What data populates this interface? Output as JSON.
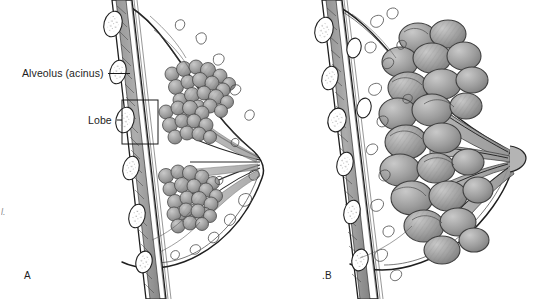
{
  "figure": {
    "type": "anatomical-illustration",
    "style": "grayscale pen-and-ink medical line drawing",
    "background_color": "#ffffff",
    "ink_color": "#1a1a1a",
    "tissue_fill_color": "#9a9a9a",
    "tissue_shadow_color": "#6e6e6e",
    "tissue_light_color": "#c8c8c8"
  },
  "labels": {
    "alveolus": "Alveolus (acinus)",
    "lobe": "Lobe"
  },
  "panels": [
    {
      "id": "A",
      "letter": "A",
      "caption": "A",
      "description": "Non-lactating (resting) breast: small clustered alveoli, slender ducts converging on the nipple",
      "nipple_position": [
        262,
        160
      ]
    },
    {
      "id": "B",
      "letter": "B",
      "caption": ".B",
      "description": "Lactating breast: enlarged engorged lobules and dilated ducts converging on the nipple",
      "nipple_position": [
        512,
        157
      ]
    }
  ],
  "annotations": [
    {
      "name": "alveolus-leader",
      "label": "Alveolus (acinus)",
      "leader_from": [
        108,
        74
      ],
      "leader_to": [
        130,
        74
      ],
      "style": "straight leader line"
    },
    {
      "name": "lobe-bracket",
      "label": "Lobe",
      "leader_from": [
        117,
        120
      ],
      "leader_to": [
        122,
        120
      ],
      "box": [
        122,
        100,
        36,
        44
      ],
      "style": "leader dash into rectangular callout box"
    }
  ],
  "edge_artifact": "l."
}
